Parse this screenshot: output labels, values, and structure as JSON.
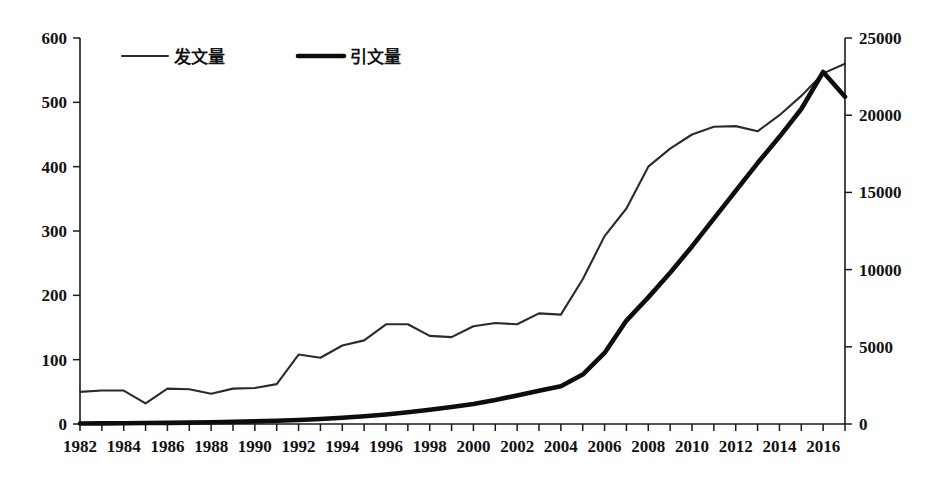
{
  "chart_data": {
    "type": "line",
    "title": "",
    "xlabel": "",
    "ylabel": "",
    "grid": false,
    "legend_position": "top-left",
    "x": [
      1982,
      1983,
      1984,
      1985,
      1986,
      1987,
      1988,
      1989,
      1990,
      1991,
      1992,
      1993,
      1994,
      1995,
      1996,
      1997,
      1998,
      1999,
      2000,
      2001,
      2002,
      2003,
      2004,
      2005,
      2006,
      2007,
      2008,
      2009,
      2010,
      2011,
      2012,
      2013,
      2014,
      2015,
      2016,
      2017
    ],
    "x_tick_labels": [
      "1982",
      "1984",
      "1986",
      "1988",
      "1990",
      "1992",
      "1994",
      "1996",
      "1998",
      "2000",
      "2002",
      "2004",
      "2006",
      "2008",
      "2010",
      "2012",
      "2014",
      "2016"
    ],
    "x_tick_label_values": [
      1982,
      1984,
      1986,
      1988,
      1990,
      1992,
      1994,
      1996,
      1998,
      2000,
      2002,
      2004,
      2006,
      2008,
      2010,
      2012,
      2014,
      2016
    ],
    "xlim": [
      1982,
      2017
    ],
    "left_axis": {
      "label": "",
      "ylim": [
        0,
        600
      ],
      "ticks": [
        0,
        100,
        200,
        300,
        400,
        500,
        600
      ],
      "tick_labels": [
        "0",
        "100",
        "200",
        "300",
        "400",
        "500",
        "600"
      ]
    },
    "right_axis": {
      "label": "",
      "ylim": [
        0,
        25000
      ],
      "ticks": [
        0,
        5000,
        10000,
        15000,
        20000,
        25000
      ],
      "tick_labels": [
        "0",
        "5000",
        "10000",
        "15000",
        "20000",
        "25000"
      ]
    },
    "series": [
      {
        "name": "发文量",
        "axis": "left",
        "style": "thin",
        "color": "#2b2b2b",
        "values": [
          50,
          52,
          52,
          32,
          55,
          54,
          47,
          55,
          56,
          62,
          108,
          103,
          122,
          130,
          155,
          155,
          137,
          135,
          152,
          157,
          155,
          172,
          170,
          225,
          292,
          335,
          400,
          428,
          450,
          462,
          463,
          455,
          480,
          510,
          545,
          560
        ]
      },
      {
        "name": "引文量",
        "axis": "right",
        "style": "thick",
        "color": "#0d0d0d",
        "values": [
          30,
          40,
          50,
          60,
          70,
          90,
          110,
          140,
          170,
          210,
          260,
          320,
          400,
          500,
          620,
          760,
          920,
          1100,
          1300,
          1550,
          1850,
          2150,
          2450,
          3200,
          4600,
          6700,
          8200,
          9800,
          11500,
          13300,
          15100,
          16900,
          18600,
          20400,
          22800,
          21200
        ]
      }
    ]
  },
  "legend": {
    "items": [
      {
        "label": "发文量",
        "style": "thin"
      },
      {
        "label": "引文量",
        "style": "thick"
      }
    ]
  }
}
